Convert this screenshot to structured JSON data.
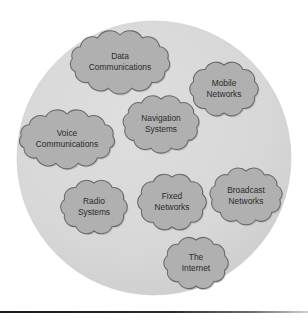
{
  "figure": {
    "type": "concept-bubble-diagram",
    "background_color": "#ffffff",
    "container": {
      "shape": "circle",
      "fill_color": "#d8d8d8",
      "center_x": 154,
      "center_y": 158,
      "radius": 137
    },
    "node_style": {
      "shape": "cloud",
      "fill_color": "#b0b0b0",
      "stroke_color": "#6a6a6a",
      "text_color": "#2b2b2b"
    },
    "artifact": {
      "name": "page-edge-scan-line",
      "color": "#1a1a1a",
      "y": 311
    },
    "nodes": [
      {
        "id": "data-communications",
        "line1": "Data",
        "line2": "Communications",
        "cx": 120,
        "cy": 62,
        "rx": 48,
        "ry": 27
      },
      {
        "id": "mobile-networks",
        "line1": "Mobile",
        "line2": "Networks",
        "cx": 224,
        "cy": 89,
        "rx": 32,
        "ry": 24
      },
      {
        "id": "navigation-systems",
        "line1": "Navigation",
        "line2": "Systems",
        "cx": 161,
        "cy": 124,
        "rx": 36,
        "ry": 25
      },
      {
        "id": "voice-communications",
        "line1": "Voice",
        "line2": "Communications",
        "cx": 67,
        "cy": 139,
        "rx": 46,
        "ry": 25
      },
      {
        "id": "radio-systems",
        "line1": "Radio",
        "line2": "Systems",
        "cx": 94,
        "cy": 207,
        "rx": 31,
        "ry": 24
      },
      {
        "id": "fixed-networks",
        "line1": "Fixed",
        "line2": "Networks",
        "cx": 172,
        "cy": 202,
        "rx": 32,
        "ry": 25
      },
      {
        "id": "broadcast-networks",
        "line1": "Broadcast",
        "line2": "Networks",
        "cx": 246,
        "cy": 196,
        "rx": 34,
        "ry": 25
      },
      {
        "id": "the-internet",
        "line1": "The",
        "line2": "Internet",
        "cx": 196,
        "cy": 263,
        "rx": 30,
        "ry": 23
      }
    ]
  }
}
